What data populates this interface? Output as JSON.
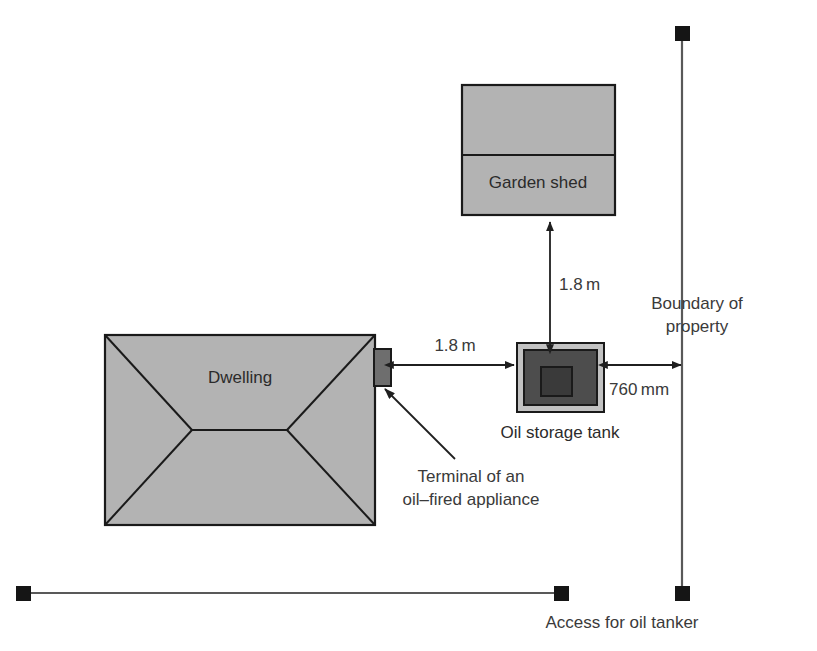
{
  "diagram": {
    "colors": {
      "fill_light": "#b3b3b3",
      "fill_dark": "#4d4d4d",
      "stroke": "#1a1a1a",
      "line": "#595959",
      "text": "#3a3a3a",
      "background": "#ffffff"
    },
    "shapes": {
      "dwelling": {
        "label": "Dwelling",
        "name": "dwelling"
      },
      "garden_shed": {
        "label": "Garden shed",
        "name": "garden-shed"
      },
      "oil_tank": {
        "label": "Oil storage tank",
        "name": "oil-storage-tank"
      },
      "terminal": {
        "label": "Terminal of an",
        "label_line2": "oil–fired appliance",
        "name": "terminal-of-oil-fired-appliance"
      }
    },
    "dimensions": [
      {
        "name": "shed-to-tank",
        "value": "1.8 m",
        "orientation": "vertical"
      },
      {
        "name": "dwelling-to-tank",
        "value": "1.8 m",
        "orientation": "horizontal"
      },
      {
        "name": "tank-to-boundary",
        "value": "760 mm",
        "orientation": "horizontal"
      }
    ],
    "annotations": {
      "boundary_line1": "Boundary of",
      "boundary_line2": "property",
      "access": "Access for oil tanker"
    }
  }
}
